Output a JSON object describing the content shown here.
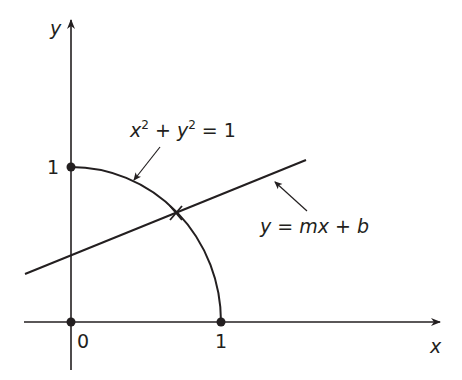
{
  "diagram": {
    "axes": {
      "x_label": "x",
      "y_label": "y",
      "tick_labels": {
        "origin": "0",
        "x_one": "1",
        "y_one": "1"
      }
    },
    "curve": {
      "name": "quarter-circle",
      "equation_parts": {
        "x": "x",
        "x_exp": "2",
        "plus": " + ",
        "y": "y",
        "y_exp": "2",
        "eq": " = 1"
      }
    },
    "line": {
      "name": "secant-line",
      "equation_parts": {
        "y": "y",
        "eq": " = ",
        "m": "m",
        "x": "x",
        "plus": " + ",
        "b": "b"
      }
    },
    "points": [
      {
        "name": "origin",
        "x": 0,
        "y": 0
      },
      {
        "name": "x-intercept",
        "x": 1,
        "y": 0
      },
      {
        "name": "y-intercept",
        "x": 0,
        "y": 1
      }
    ],
    "intersection_marker": "cross",
    "colors": {
      "ink": "#231f20",
      "background": "#ffffff"
    }
  }
}
